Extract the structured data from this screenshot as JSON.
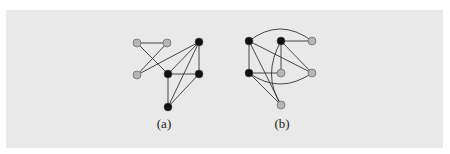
{
  "figure": {
    "background": "#e9e9e9",
    "node_colors": {
      "black": "#111111",
      "gray": "#b5b5b5"
    },
    "edge_color": "#333333",
    "graphs": [
      {
        "id": "a",
        "label": "(a)",
        "label_pos": [
          164,
          124
        ],
        "nodes": [
          {
            "id": "a1",
            "x": 137,
            "y": 43,
            "color": "gray"
          },
          {
            "id": "a2",
            "x": 167,
            "y": 43,
            "color": "gray"
          },
          {
            "id": "a3",
            "x": 137,
            "y": 75,
            "color": "gray"
          },
          {
            "id": "a4",
            "x": 199,
            "y": 42,
            "color": "black"
          },
          {
            "id": "a5",
            "x": 168,
            "y": 74,
            "color": "black"
          },
          {
            "id": "a6",
            "x": 199,
            "y": 74,
            "color": "black"
          },
          {
            "id": "a7",
            "x": 168,
            "y": 107,
            "color": "black"
          }
        ],
        "edges": [
          {
            "from": "a1",
            "to": "a2"
          },
          {
            "from": "a1",
            "to": "a5"
          },
          {
            "from": "a2",
            "to": "a3"
          },
          {
            "from": "a3",
            "to": "a4"
          },
          {
            "from": "a4",
            "to": "a5"
          },
          {
            "from": "a4",
            "to": "a6"
          },
          {
            "from": "a4",
            "to": "a7"
          },
          {
            "from": "a5",
            "to": "a6"
          },
          {
            "from": "a5",
            "to": "a7"
          },
          {
            "from": "a6",
            "to": "a7"
          }
        ]
      },
      {
        "id": "b",
        "label": "(b)",
        "label_pos": [
          282,
          124
        ],
        "nodes": [
          {
            "id": "b1",
            "x": 249,
            "y": 41,
            "color": "black"
          },
          {
            "id": "b2",
            "x": 281,
            "y": 41,
            "color": "black"
          },
          {
            "id": "b3",
            "x": 312,
            "y": 41,
            "color": "gray"
          },
          {
            "id": "b4",
            "x": 249,
            "y": 73,
            "color": "black"
          },
          {
            "id": "b5",
            "x": 281,
            "y": 73,
            "color": "gray"
          },
          {
            "id": "b6",
            "x": 312,
            "y": 73,
            "color": "gray"
          },
          {
            "id": "b7",
            "x": 281,
            "y": 105,
            "color": "gray"
          }
        ],
        "edges": [
          {
            "from": "b1",
            "to": "b3",
            "curve": "M249,41 Q280,17 312,41"
          },
          {
            "from": "b1",
            "to": "b4"
          },
          {
            "from": "b1",
            "to": "b6"
          },
          {
            "from": "b1",
            "to": "b7"
          },
          {
            "from": "b2",
            "to": "b3"
          },
          {
            "from": "b2",
            "to": "b5"
          },
          {
            "from": "b2",
            "to": "b6"
          },
          {
            "from": "b2",
            "to": "b7",
            "curve": "M281,41 Q262,75 281,105"
          },
          {
            "from": "b4",
            "to": "b5"
          },
          {
            "from": "b4",
            "to": "b6",
            "curve": "M249,73 Q280,95 312,73"
          },
          {
            "from": "b4",
            "to": "b7"
          }
        ]
      }
    ]
  }
}
